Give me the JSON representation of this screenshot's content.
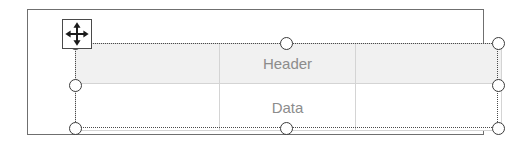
{
  "scene": {
    "description": "Slide editor showing a selected table object being moved",
    "canvas_width": 511,
    "canvas_height": 143,
    "background_color": "#ffffff"
  },
  "slide": {
    "frame_border_color": "#6f6f6f",
    "background_color": "#ffffff"
  },
  "table": {
    "columns": 3,
    "rows": 2,
    "grid_line_color": "#d4d4d4",
    "header_fill": "#f1f1f1",
    "body_fill": "#ffffff",
    "text_color": "#8c8c8c",
    "header_row": [
      "",
      "Header",
      ""
    ],
    "data_rows": [
      [
        "",
        "Data",
        ""
      ]
    ]
  },
  "selection": {
    "border_style": "dotted",
    "border_color": "#4a4a4a",
    "handle_fill": "#ffffff",
    "handle_stroke": "#3b3b3b",
    "handles": [
      {
        "name": "handle-top-left",
        "position": "nw"
      },
      {
        "name": "handle-top-center",
        "position": "n"
      },
      {
        "name": "handle-top-right",
        "position": "ne"
      },
      {
        "name": "handle-middle-left",
        "position": "w"
      },
      {
        "name": "handle-middle-right",
        "position": "e"
      },
      {
        "name": "handle-bottom-left",
        "position": "sw"
      },
      {
        "name": "handle-bottom-center",
        "position": "s"
      },
      {
        "name": "handle-bottom-right",
        "position": "se"
      }
    ]
  },
  "cursor": {
    "icon": "move-cursor-icon",
    "label": "Move",
    "stroke_color": "#1a1a1a",
    "box_border_color": "#4a4a4a"
  }
}
